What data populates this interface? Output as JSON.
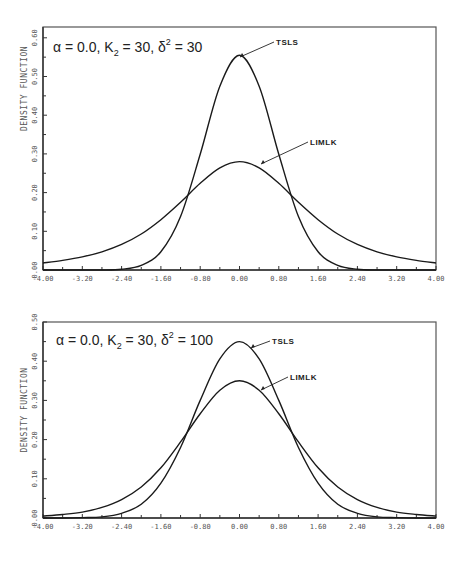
{
  "chart_data": [
    {
      "type": "line",
      "title": "α = 0.0, K2 = 30, δ² = 30",
      "title_parts": {
        "alpha": "α = 0.0,",
        "k": "K",
        "k_sub": "2",
        "k_val": "= 30,",
        "delta": "δ",
        "delta_sup": "2",
        "delta_val": "= 30"
      },
      "xlabel": "",
      "ylabel": "DENSITY FUNCTION",
      "xlim": [
        -4.0,
        4.0
      ],
      "ylim": [
        0.0,
        0.63
      ],
      "xticks": [
        "-4.00",
        "-3.20",
        "-2.40",
        "-1.60",
        "-0.80",
        "0.00",
        "0.80",
        "1.60",
        "2.40",
        "3.20",
        "4.00"
      ],
      "yticks": [
        "0.00",
        "0.10",
        "0.20",
        "0.30",
        "0.40",
        "0.50",
        "0.60"
      ],
      "grid": false,
      "legend": "inline annotations with arrows",
      "x": [
        -4.0,
        -3.6,
        -3.2,
        -2.8,
        -2.4,
        -2.0,
        -1.6,
        -1.2,
        -0.8,
        -0.4,
        0.0,
        0.4,
        0.8,
        1.2,
        1.6,
        2.0,
        2.4,
        2.8,
        3.2,
        3.6,
        4.0
      ],
      "series": [
        {
          "name": "TSLS",
          "values": [
            0.0,
            0.0,
            0.0,
            0.0,
            0.002,
            0.012,
            0.047,
            0.138,
            0.299,
            0.475,
            0.555,
            0.475,
            0.299,
            0.138,
            0.047,
            0.012,
            0.002,
            0.0,
            0.0,
            0.0,
            0.0
          ]
        },
        {
          "name": "LIMLK",
          "values": [
            0.018,
            0.025,
            0.034,
            0.047,
            0.066,
            0.093,
            0.13,
            0.175,
            0.224,
            0.264,
            0.28,
            0.264,
            0.224,
            0.175,
            0.13,
            0.093,
            0.066,
            0.047,
            0.034,
            0.025,
            0.018
          ]
        }
      ],
      "annotations": [
        "TSLS",
        "LIMLK"
      ]
    },
    {
      "type": "line",
      "title": "α = 0.0, K2 = 30, δ² = 100",
      "title_parts": {
        "alpha": "α = 0.0,",
        "k": "K",
        "k_sub": "2",
        "k_val": "= 30,",
        "delta": "δ",
        "delta_sup": "2",
        "delta_val": "= 100"
      },
      "xlabel": "",
      "ylabel": "DENSITY FUNCTION",
      "xlim": [
        -4.0,
        4.0
      ],
      "ylim": [
        0.0,
        0.5
      ],
      "xticks": [
        "-4.00",
        "-3.20",
        "-2.40",
        "-1.60",
        "-0.80",
        "0.00",
        "0.80",
        "1.60",
        "2.40",
        "3.20",
        "4.00"
      ],
      "yticks": [
        "0.00",
        "0.10",
        "0.20",
        "0.30",
        "0.40",
        "0.50"
      ],
      "grid": false,
      "legend": "inline annotations with arrows",
      "x": [
        -4.0,
        -3.6,
        -3.2,
        -2.8,
        -2.4,
        -2.0,
        -1.6,
        -1.2,
        -0.8,
        -0.4,
        0.0,
        0.4,
        0.8,
        1.2,
        1.6,
        2.0,
        2.4,
        2.8,
        3.2,
        3.6,
        4.0
      ],
      "series": [
        {
          "name": "TSLS",
          "values": [
            0.0,
            0.0,
            0.001,
            0.003,
            0.012,
            0.035,
            0.089,
            0.18,
            0.3,
            0.406,
            0.45,
            0.406,
            0.3,
            0.18,
            0.089,
            0.035,
            0.012,
            0.003,
            0.001,
            0.0,
            0.0
          ]
        },
        {
          "name": "LIMLK",
          "values": [
            0.005,
            0.009,
            0.015,
            0.027,
            0.047,
            0.079,
            0.128,
            0.194,
            0.266,
            0.326,
            0.35,
            0.326,
            0.266,
            0.194,
            0.128,
            0.079,
            0.047,
            0.027,
            0.015,
            0.009,
            0.005
          ]
        }
      ],
      "annotations": [
        "TSLS",
        "LIMLK"
      ]
    }
  ],
  "layout": {
    "plots": [
      {
        "left": 43,
        "right": 436,
        "top": 27,
        "bottom": 270,
        "y0px": 270,
        "yUnitPx": 387,
        "labels": {
          "TSLS": {
            "x": 276,
            "y": 45,
            "ax": 240,
            "ay": 57
          },
          "LIMLK": {
            "x": 310,
            "y": 145,
            "ax": 261,
            "ay": 164
          }
        },
        "title_pos": {
          "x": 53,
          "y": 52
        }
      },
      {
        "left": 43,
        "right": 436,
        "top": 322,
        "bottom": 518,
        "y0px": 518,
        "yUnitPx": 392,
        "labels": {
          "TSLS": {
            "x": 272,
            "y": 344,
            "ax": 251,
            "ay": 348
          },
          "LIMLK": {
            "x": 290,
            "y": 380,
            "ax": 261,
            "ay": 390
          }
        },
        "title_pos": {
          "x": 56,
          "y": 345
        }
      }
    ]
  }
}
